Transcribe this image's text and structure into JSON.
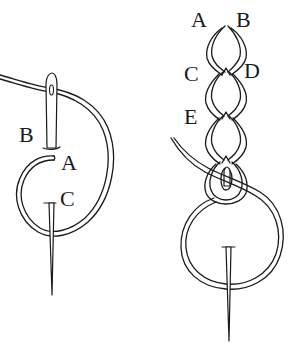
{
  "diagram": {
    "type": "chain-stitch-illustration",
    "background": "#ffffff",
    "ink_color": "#1a1a1a",
    "left_figure": {
      "description": "Needle inserted at B beside A, thread looped around, emerging at C",
      "labels": {
        "a": "A",
        "b": "B",
        "c": "C"
      }
    },
    "right_figure": {
      "description": "Completed chain of loops with needle forming next loop",
      "labels": {
        "a": "A",
        "b": "B",
        "c": "C",
        "d": "D",
        "e": "E"
      }
    }
  }
}
